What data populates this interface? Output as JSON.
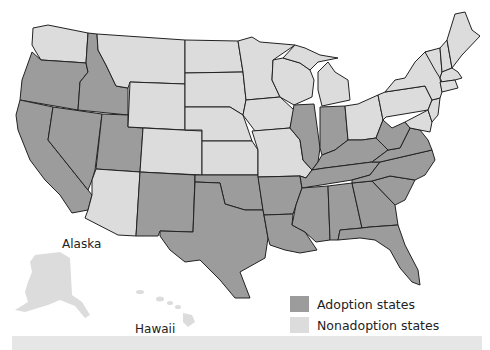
{
  "map": {
    "type": "choropleth",
    "region": "United States",
    "colors": {
      "adoption": "#9c9c9c",
      "nonadoption": "#dcdcdc",
      "border": "#222222"
    },
    "adoption_states": [
      "Oregon",
      "California",
      "Idaho",
      "Nevada",
      "Utah",
      "New Mexico",
      "Texas",
      "Oklahoma",
      "Arkansas",
      "Louisiana",
      "Mississippi",
      "Alabama",
      "Georgia",
      "Florida",
      "South Carolina",
      "North Carolina",
      "Tennessee",
      "Kentucky",
      "Virginia",
      "West Virginia",
      "Illinois",
      "Indiana"
    ],
    "nonadoption_states": [
      "Washington",
      "Montana",
      "Wyoming",
      "Colorado",
      "Arizona",
      "North Dakota",
      "South Dakota",
      "Nebraska",
      "Kansas",
      "Minnesota",
      "Iowa",
      "Missouri",
      "Wisconsin",
      "Michigan",
      "Ohio",
      "Pennsylvania",
      "New York",
      "Vermont",
      "New Hampshire",
      "Maine",
      "Massachusetts",
      "Rhode Island",
      "Connecticut",
      "New Jersey",
      "Delaware",
      "Maryland",
      "Alaska",
      "Hawaii"
    ]
  },
  "labels": {
    "alaska": "Alaska",
    "hawaii": "Hawaii"
  },
  "legend": {
    "items": [
      {
        "label": "Adoption states",
        "color": "#9c9c9c"
      },
      {
        "label": "Nonadoption states",
        "color": "#dcdcdc"
      }
    ]
  }
}
